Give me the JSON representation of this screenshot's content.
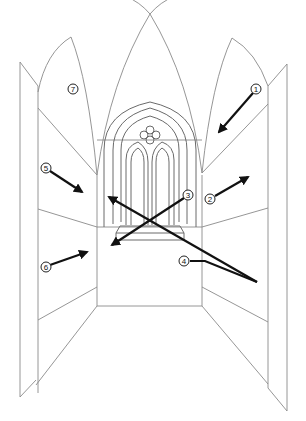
{
  "diagram": {
    "line_color": "#8a8a8a",
    "arrow_color": "#111111",
    "callouts": [
      {
        "id": "1",
        "label": "1",
        "x": 256,
        "y": 89
      },
      {
        "id": "2",
        "label": "2",
        "x": 210,
        "y": 199
      },
      {
        "id": "3",
        "label": "3",
        "x": 188,
        "y": 195
      },
      {
        "id": "4",
        "label": "4",
        "x": 184,
        "y": 261
      },
      {
        "id": "5",
        "label": "5",
        "x": 46,
        "y": 168
      },
      {
        "id": "6",
        "label": "6",
        "x": 46,
        "y": 267
      },
      {
        "id": "7",
        "label": "7",
        "x": 73,
        "y": 89
      }
    ]
  }
}
